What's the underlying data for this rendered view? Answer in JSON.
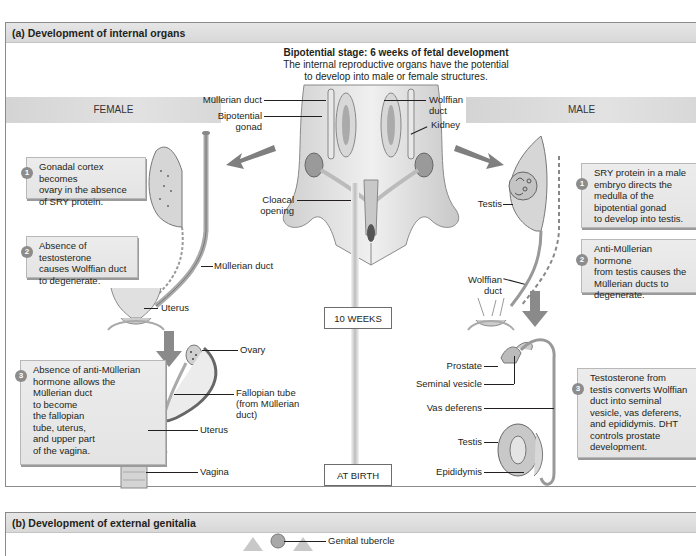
{
  "panel_a": {
    "header": "(a) Development of internal organs",
    "bipotential_title": "Bipotential stage: 6 weeks of fetal development",
    "bipotential_desc_line1": "The internal reproductive organs have the potential",
    "bipotential_desc_line2": "to develop into male or female structures.",
    "female_band": "FEMALE",
    "male_band": "MALE",
    "center_labels": {
      "mullerian_duct": "Müllerian duct",
      "bipotential_gonad_1": "Bipotential",
      "bipotential_gonad_2": "gonad",
      "wolffian_duct_1": "Wolffian",
      "wolffian_duct_2": "duct",
      "kidney": "Kidney",
      "cloacal_opening_1": "Cloacal",
      "cloacal_opening_2": "opening"
    },
    "timeline": {
      "ten_weeks": "10 WEEKS",
      "at_birth": "AT BIRTH"
    },
    "female": {
      "callouts": [
        {
          "number": "1",
          "lines": [
            "Gonadal cortex becomes",
            "ovary in the absence",
            "of SRY protein."
          ]
        },
        {
          "number": "2",
          "lines": [
            "Absence of testosterone",
            "causes Wolffian duct",
            "to degenerate."
          ]
        },
        {
          "number": "3",
          "lines": [
            "Absence of anti-Müllerian",
            "hormone allows the",
            "Müllerian duct",
            "to become",
            "the fallopian",
            "tube, uterus,",
            "and upper part",
            "of the vagina."
          ]
        }
      ],
      "labels": {
        "mullerian_duct": "Müllerian duct",
        "uterus_upper": "Uterus",
        "ovary": "Ovary",
        "fallopian_1": "Fallopian tube",
        "fallopian_2": "(from Müllerian",
        "fallopian_3": "duct)",
        "uterus_lower": "Uterus",
        "vagina": "Vagina"
      }
    },
    "male": {
      "callouts": [
        {
          "number": "1",
          "lines": [
            "SRY protein in a male",
            "embryo directs the",
            "medulla of the",
            "bipotential gonad",
            "to develop into testis."
          ]
        },
        {
          "number": "2",
          "lines": [
            "Anti-Müllerian hormone",
            "from testis causes the",
            "Müllerian ducts to",
            "degenerate."
          ]
        },
        {
          "number": "3",
          "lines": [
            "Testosterone from",
            "testis converts Wolffian",
            "duct into seminal",
            "vesicle, vas deferens,",
            "and epididymis. DHT",
            "controls prostate",
            "development."
          ]
        }
      ],
      "labels": {
        "testis_upper": "Testis",
        "wolffian_1": "Wolffian",
        "wolffian_2": "duct",
        "prostate": "Prostate",
        "seminal_vesicle": "Seminal vesicle",
        "vas_deferens": "Vas deferens",
        "testis_lower": "Testis",
        "epididymis": "Epididymis"
      }
    }
  },
  "panel_b": {
    "header": "(b) Development of external genitalia",
    "genital_tubercle": "Genital tubercle"
  },
  "colors": {
    "header_bg": "#dcdcdc",
    "callout_bg": "#e8e8e8",
    "badge": "#8c8c8c",
    "arrow": "#7a7a7a",
    "organ": "#d9d9d9",
    "text": "#231f20"
  }
}
